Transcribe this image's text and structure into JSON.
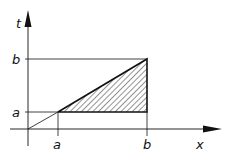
{
  "diagram": {
    "type": "integration-region",
    "axes": {
      "horizontal_label": "x",
      "vertical_label": "t"
    },
    "tick_labels": {
      "x_a": "a",
      "x_b": "b",
      "t_a": "a",
      "t_b": "b"
    },
    "elements": [
      "diagonal line t = x from origin",
      "horizontal line t = a",
      "horizontal line t = b",
      "vertical line x = a",
      "vertical line x = b",
      "hatched triangle bounded by t = a, x = b, t = x"
    ],
    "colors": {
      "ink": "#111111",
      "background": "#ffffff"
    }
  }
}
